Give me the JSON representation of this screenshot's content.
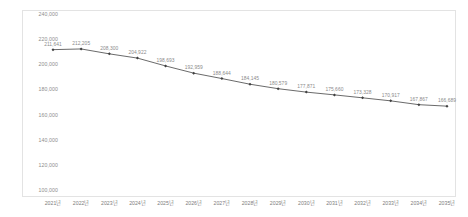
{
  "chart_data": {
    "type": "line",
    "title": "",
    "subtitle": "",
    "xlabel": "",
    "ylabel": "",
    "categories": [
      "2021년",
      "2022년",
      "2023년",
      "2024년",
      "2025년",
      "2026년",
      "2027년",
      "2028년",
      "2029년",
      "2030년",
      "2031년",
      "2032년",
      "2033년",
      "2034년",
      "2035년"
    ],
    "values": [
      211641,
      212205,
      208300,
      204922,
      198693,
      192959,
      188644,
      184145,
      180579,
      177871,
      175660,
      173328,
      170917,
      167867,
      166689
    ],
    "data_labels": [
      "211,641",
      "212,205",
      "208,300",
      "204,922",
      "198,693",
      "192,959",
      "188,644",
      "184,145",
      "180,579",
      "177,871",
      "175,660",
      "173,328",
      "170,917",
      "167,867",
      "166,689"
    ],
    "ylim": [
      100000,
      240000
    ],
    "ytick_values": [
      100000,
      120000,
      140000,
      160000,
      180000,
      200000,
      220000,
      240000
    ],
    "ytick_labels": [
      "100,000",
      "120,000",
      "140,000",
      "160,000",
      "180,000",
      "200,000",
      "220,000",
      "240,000"
    ],
    "grid": false,
    "legend": false,
    "legend_position": "none",
    "series": [
      {
        "name": "",
        "values": [
          211641,
          212205,
          208300,
          204922,
          198693,
          192959,
          188644,
          184145,
          180579,
          177871,
          175660,
          173328,
          170917,
          167867,
          166689
        ],
        "line_color": "#595959",
        "marker": "diamond",
        "marker_color": "#404040"
      }
    ]
  },
  "style": {
    "background": "#ffffff",
    "border_color": "#e3e3e3",
    "axis_text_color": "#8d8d8d",
    "label_text_color": "#8a8a8a",
    "line_color": "#595959"
  }
}
